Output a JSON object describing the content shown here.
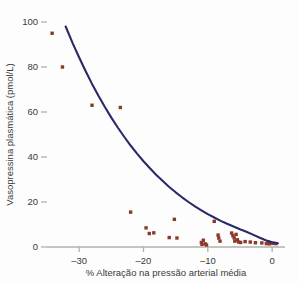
{
  "chart_data": {
    "type": "scatter",
    "title": "",
    "xlabel": "% Alteração na pressão arterial média",
    "ylabel": "Vasopressina plasmática (pmol/L)",
    "xlim": [
      -35,
      2
    ],
    "ylim": [
      0,
      100
    ],
    "xticks": [
      -30,
      -20,
      -10,
      0
    ],
    "xticklabels": [
      "–30",
      "–20",
      "–10",
      "0"
    ],
    "yticks": [
      0,
      20,
      40,
      60,
      80,
      100
    ],
    "yticklabels": [
      "0",
      "20",
      "40",
      "60",
      "80",
      "100"
    ],
    "grid": false,
    "legend": null,
    "point_color": "#8b3a2a",
    "curve_color": "#2a2a6a",
    "axis_color": "#b0b0b0",
    "text_color": "#3a3a3a",
    "series": [
      {
        "name": "Observações",
        "type": "scatter",
        "points": [
          [
            -34.2,
            95.0
          ],
          [
            -32.6,
            80.0
          ],
          [
            -28.0,
            63.0
          ],
          [
            -23.6,
            62.0
          ],
          [
            -22.0,
            15.5
          ],
          [
            -19.6,
            8.5
          ],
          [
            -19.1,
            6.0
          ],
          [
            -18.4,
            6.3
          ],
          [
            -16.0,
            4.2
          ],
          [
            -15.2,
            12.3
          ],
          [
            -14.8,
            4.0
          ],
          [
            -11.0,
            2.0
          ],
          [
            -10.9,
            1.2
          ],
          [
            -10.7,
            3.0
          ],
          [
            -10.4,
            1.4
          ],
          [
            -10.2,
            0.9
          ],
          [
            -9.0,
            11.4
          ],
          [
            -8.4,
            5.3
          ],
          [
            -8.3,
            4.0
          ],
          [
            -8.1,
            2.6
          ],
          [
            -6.3,
            6.2
          ],
          [
            -6.1,
            5.0
          ],
          [
            -5.9,
            4.0
          ],
          [
            -5.8,
            2.6
          ],
          [
            -5.6,
            5.6
          ],
          [
            -5.4,
            3.2
          ],
          [
            -5.2,
            2.2
          ],
          [
            -4.9,
            2.0
          ],
          [
            -4.2,
            2.4
          ],
          [
            -3.4,
            2.2
          ],
          [
            -2.6,
            1.9
          ],
          [
            -1.6,
            1.8
          ],
          [
            -0.9,
            1.5
          ],
          [
            -0.6,
            2.2
          ],
          [
            -0.4,
            1.4
          ],
          [
            -0.2,
            1.8
          ],
          [
            0.2,
            1.6
          ],
          [
            0.6,
            1.5
          ]
        ]
      },
      {
        "name": "Curva de ajuste exponencial",
        "type": "line",
        "points": [
          [
            -32.1,
            98.0
          ],
          [
            -31.0,
            90.5
          ],
          [
            -30.0,
            84.2
          ],
          [
            -29.0,
            78.2
          ],
          [
            -28.0,
            72.5
          ],
          [
            -27.0,
            67.2
          ],
          [
            -26.0,
            62.2
          ],
          [
            -25.0,
            57.5
          ],
          [
            -24.0,
            53.1
          ],
          [
            -23.0,
            49.0
          ],
          [
            -22.0,
            45.1
          ],
          [
            -21.0,
            41.5
          ],
          [
            -20.0,
            38.1
          ],
          [
            -19.0,
            35.0
          ],
          [
            -18.0,
            32.0
          ],
          [
            -17.0,
            29.3
          ],
          [
            -16.0,
            26.7
          ],
          [
            -15.0,
            24.3
          ],
          [
            -14.0,
            22.1
          ],
          [
            -13.0,
            20.0
          ],
          [
            -12.0,
            18.1
          ],
          [
            -11.0,
            16.3
          ],
          [
            -10.0,
            14.6
          ],
          [
            -9.0,
            13.1
          ],
          [
            -8.0,
            11.6
          ],
          [
            -7.0,
            10.3
          ],
          [
            -6.0,
            9.1
          ],
          [
            -5.0,
            7.9
          ],
          [
            -4.0,
            6.8
          ],
          [
            -3.0,
            5.5
          ],
          [
            -2.0,
            4.2
          ],
          [
            -1.0,
            3.0
          ],
          [
            0.0,
            2.1
          ],
          [
            0.9,
            1.7
          ]
        ]
      }
    ]
  }
}
